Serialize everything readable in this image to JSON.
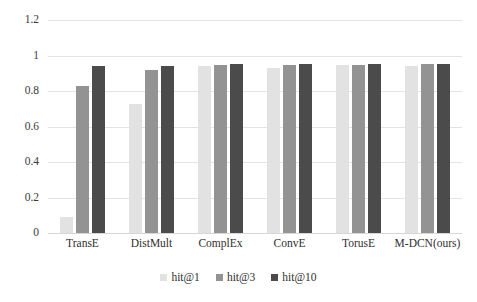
{
  "chart_data": {
    "type": "bar",
    "title": "",
    "subtitle": "",
    "xlabel": "",
    "ylabel": "",
    "categories": [
      "TransE",
      "DistMult",
      "ComplEx",
      "ConvE",
      "TorusE",
      "M-DCN(ours)"
    ],
    "series": [
      {
        "name": "hit@1",
        "color": "#e2e2e2",
        "values": [
          0.09,
          0.725,
          0.94,
          0.93,
          0.945,
          0.94
        ]
      },
      {
        "name": "hit@3",
        "color": "#939393",
        "values": [
          0.83,
          0.92,
          0.945,
          0.945,
          0.945,
          0.95
        ]
      },
      {
        "name": "hit@10",
        "color": "#4b4b4b",
        "values": [
          0.94,
          0.94,
          0.95,
          0.95,
          0.95,
          0.955
        ]
      }
    ],
    "ylim": [
      0,
      1.2
    ],
    "ytick_labels": [
      "1.2",
      "1",
      "0.8",
      "0.6",
      "0.4",
      "0.2",
      "0"
    ],
    "ytick_values": [
      1.2,
      1,
      0.8,
      0.6,
      0.4,
      0.2,
      0
    ],
    "grid": true,
    "grid_axis": "y",
    "legend_position": "bottom-center",
    "legend_entries": [
      "hit@1",
      "hit@3",
      "hit@10"
    ],
    "annotations": []
  }
}
